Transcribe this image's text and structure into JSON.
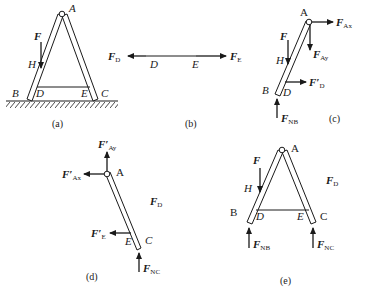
{
  "figure": {
    "panels": [
      {
        "id": "a",
        "caption": "(a)",
        "points": {
          "A": "A",
          "B": "B",
          "C": "C",
          "D": "D",
          "E": "E",
          "H": "H"
        },
        "forces": {
          "F": {
            "main": "F",
            "sub": ""
          }
        }
      },
      {
        "id": "b",
        "caption": "(b)",
        "points": {
          "D": "D",
          "E": "E"
        },
        "forces": {
          "FD": {
            "main": "F",
            "sub": "D"
          },
          "FE": {
            "main": "F",
            "sub": "E"
          }
        }
      },
      {
        "id": "c",
        "caption": "(c)",
        "points": {
          "A": "A",
          "B": "B",
          "D": "D",
          "H": "H"
        },
        "forces": {
          "F": {
            "main": "F",
            "sub": ""
          },
          "FAx": {
            "main": "F",
            "sub": "Ax"
          },
          "FAy": {
            "main": "F",
            "sub": "Ay"
          },
          "FDp": {
            "main": "F′",
            "sub": "D"
          },
          "FNB": {
            "main": "F",
            "sub": "NB"
          }
        }
      },
      {
        "id": "d",
        "caption": "(d)",
        "points": {
          "A": "A",
          "C": "C",
          "E": "E"
        },
        "forces": {
          "FAyp": {
            "main": "F′",
            "sub": "Ay"
          },
          "FAxp": {
            "main": "F′",
            "sub": "Ax"
          },
          "FD": {
            "main": "F",
            "sub": "D"
          },
          "FEp": {
            "main": "F′",
            "sub": "E"
          },
          "FNC": {
            "main": "F",
            "sub": "NC"
          }
        }
      },
      {
        "id": "e",
        "caption": "(e)",
        "points": {
          "A": "A",
          "B": "B",
          "C": "C",
          "D": "D",
          "E": "E",
          "H": "H"
        },
        "forces": {
          "F": {
            "main": "F",
            "sub": ""
          },
          "FD": {
            "main": "F",
            "sub": "D"
          },
          "FNB": {
            "main": "F",
            "sub": "NB"
          },
          "FNC": {
            "main": "F",
            "sub": "NC"
          }
        }
      }
    ]
  }
}
